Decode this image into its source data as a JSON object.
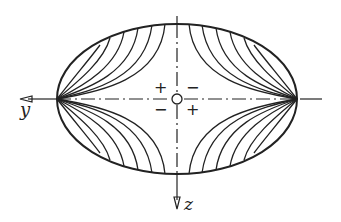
{
  "diagram": {
    "axes": {
      "horizontal_label": "y",
      "vertical_label": "z"
    },
    "quadrant_signs": {
      "upper_left": "+",
      "upper_right": "−",
      "lower_left": "−",
      "lower_right": "+"
    },
    "colors": {
      "line": "#222222",
      "background": "#ffffff"
    },
    "geometry": {
      "center": [
        177,
        99
      ],
      "semi_axis_horizontal": 120,
      "semi_axis_vertical": 75,
      "contour_lines_per_quadrant": 6
    }
  }
}
